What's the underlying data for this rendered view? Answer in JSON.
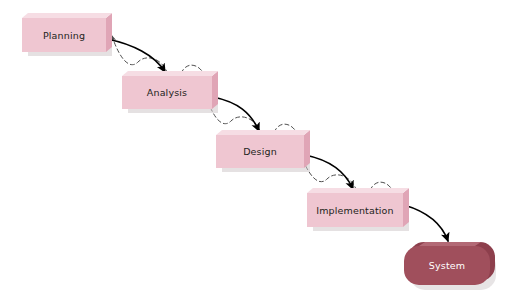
{
  "diagram": {
    "type": "waterfall-process-flow",
    "background_color": "#ffffff",
    "stage_box_fill": "#efc6d1",
    "stage_box_side": "#e0a5b6",
    "stage_box_top_bevel": "#f6dde4",
    "stage_box_shadow": "#cfc9cb",
    "terminal_box_fill": "#a04f5c",
    "terminal_box_side": "#8d3f4c",
    "terminal_box_top_bevel": "#b9717c",
    "label_color": "#231f20",
    "terminal_label_color": "#ffffff",
    "forward_arrow_color": "#000000",
    "feedback_arrow_color": "#4d4d4d",
    "stages": [
      {
        "id": "planning",
        "label": "Planning",
        "x": 22,
        "y": 18,
        "width": 84,
        "height": 34,
        "kind": "process"
      },
      {
        "id": "analysis",
        "label": "Analysis",
        "x": 122,
        "y": 76,
        "width": 90,
        "height": 33,
        "kind": "process"
      },
      {
        "id": "design",
        "label": "Design",
        "x": 216,
        "y": 135,
        "width": 88,
        "height": 33,
        "kind": "process"
      },
      {
        "id": "implementation",
        "label": "Implementation",
        "x": 307,
        "y": 193,
        "width": 96,
        "height": 34,
        "kind": "process"
      },
      {
        "id": "system",
        "label": "System",
        "x": 404,
        "y": 246,
        "width": 86,
        "height": 39,
        "kind": "terminal"
      }
    ],
    "forward_arrows": [
      {
        "id": "planning-to-analysis",
        "from": "planning",
        "to": "analysis"
      },
      {
        "id": "analysis-to-design",
        "from": "analysis",
        "to": "design"
      },
      {
        "id": "design-to-implementation",
        "from": "design",
        "to": "implementation"
      },
      {
        "id": "implementation-to-system",
        "from": "implementation",
        "to": "system"
      }
    ],
    "feedback_arrows": [
      {
        "id": "analysis-to-planning",
        "from": "analysis",
        "to": "planning",
        "style": "dashed-wavy"
      },
      {
        "id": "design-to-analysis",
        "from": "design",
        "to": "analysis",
        "style": "dashed-wavy"
      },
      {
        "id": "implementation-to-design",
        "from": "implementation",
        "to": "design",
        "style": "dashed-wavy"
      }
    ]
  }
}
